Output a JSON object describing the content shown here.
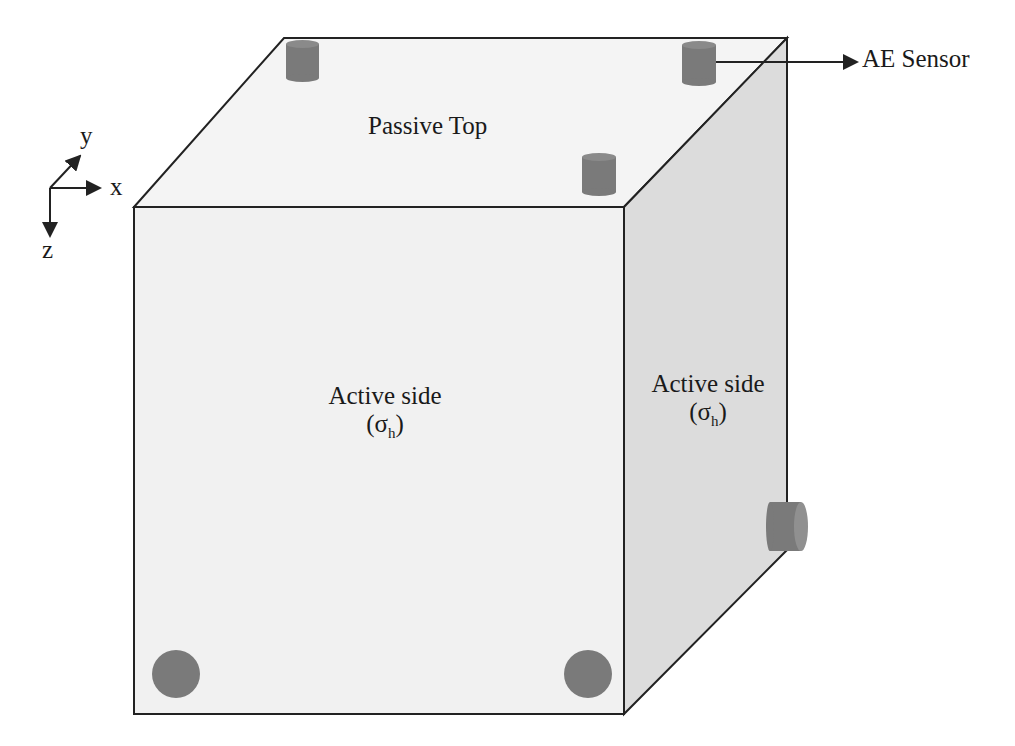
{
  "diagram": {
    "labels": {
      "top_face": "Passive Top",
      "front_face": "Active side",
      "front_face_stress": "σ",
      "front_face_stress_sub": "h",
      "side_face": "Active side",
      "side_face_stress": "σ",
      "side_face_stress_sub": "h",
      "sensor": "AE Sensor"
    },
    "axes": {
      "x": "x",
      "y": "y",
      "z": "z"
    },
    "colors": {
      "front_face": "#f2f2f2",
      "top_face": "#f4f4f4",
      "side_face": "#dcdcdc",
      "sensor": "#7a7a7a",
      "edge": "#222222"
    },
    "sensor_count": 6
  }
}
